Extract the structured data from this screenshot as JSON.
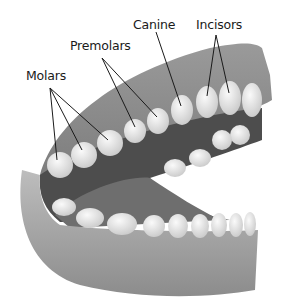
{
  "diagram": {
    "labels": [
      {
        "id": "molars",
        "text": "Molars",
        "x": 26,
        "y": 68
      },
      {
        "id": "premolars",
        "text": "Premolars",
        "x": 70,
        "y": 38
      },
      {
        "id": "canine",
        "text": "Canine",
        "x": 133,
        "y": 17
      },
      {
        "id": "incisors",
        "text": "Incisors",
        "x": 196,
        "y": 17
      }
    ],
    "leader_lines": [
      {
        "label": "molars",
        "from": [
          50,
          88
        ],
        "to": [
          57,
          160
        ]
      },
      {
        "label": "molars",
        "from": [
          50,
          88
        ],
        "to": [
          82,
          150
        ]
      },
      {
        "label": "molars",
        "from": [
          50,
          88
        ],
        "to": [
          108,
          140
        ]
      },
      {
        "label": "premolars",
        "from": [
          102,
          58
        ],
        "to": [
          135,
          127
        ]
      },
      {
        "label": "premolars",
        "from": [
          102,
          58
        ],
        "to": [
          157,
          117
        ]
      },
      {
        "label": "canine",
        "from": [
          156,
          32
        ],
        "to": [
          181,
          106
        ]
      },
      {
        "label": "incisors",
        "from": [
          216,
          35
        ],
        "to": [
          207,
          96
        ]
      },
      {
        "label": "incisors",
        "from": [
          216,
          35
        ],
        "to": [
          229,
          93
        ]
      }
    ],
    "colors": {
      "gum": "#8a8a8a",
      "gum_light": "#b5b5b5",
      "tooth": "#ececec",
      "mouth_dark": "#4a4a4a",
      "line": "#1a1a1a"
    }
  }
}
